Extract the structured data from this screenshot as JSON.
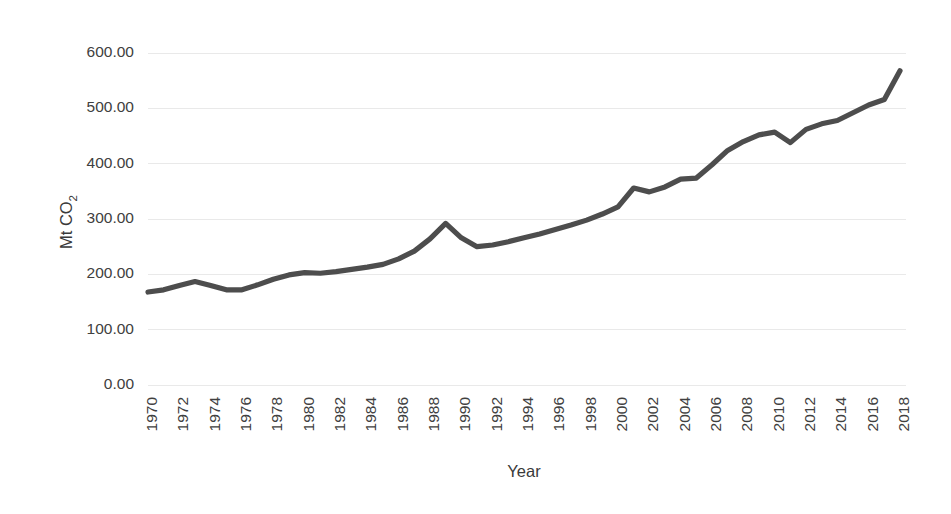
{
  "chart_data": {
    "type": "line",
    "title": "",
    "xlabel": "Year",
    "ylabel": "Mt CO2",
    "ylabel_base": "Mt CO",
    "ylabel_sub": "2",
    "xlim": [
      1970,
      2018
    ],
    "ylim": [
      0,
      600
    ],
    "grid": true,
    "legend": false,
    "line_color": "#4d4d4d",
    "ytick_labels": [
      "600.00",
      "500.00",
      "400.00",
      "300.00",
      "200.00",
      "100.00",
      "0.00"
    ],
    "ytick_values": [
      600,
      500,
      400,
      300,
      200,
      100,
      0
    ],
    "xtick_labels": [
      "1970",
      "1972",
      "1974",
      "1976",
      "1978",
      "1980",
      "1982",
      "1984",
      "1986",
      "1988",
      "1990",
      "1992",
      "1994",
      "1996",
      "1998",
      "2000",
      "2002",
      "2004",
      "2006",
      "2008",
      "2010",
      "2012",
      "2014",
      "2016",
      "2018"
    ],
    "xtick_values": [
      1970,
      1972,
      1974,
      1976,
      1978,
      1980,
      1982,
      1984,
      1986,
      1988,
      1990,
      1992,
      1994,
      1996,
      1998,
      2000,
      2002,
      2004,
      2006,
      2008,
      2010,
      2012,
      2014,
      2016,
      2018
    ],
    "x": [
      1970,
      1971,
      1972,
      1973,
      1974,
      1975,
      1976,
      1977,
      1978,
      1979,
      1980,
      1981,
      1982,
      1983,
      1984,
      1985,
      1986,
      1987,
      1988,
      1989,
      1990,
      1991,
      1992,
      1993,
      1994,
      1995,
      1996,
      1997,
      1998,
      1999,
      2000,
      2001,
      2002,
      2003,
      2004,
      2005,
      2006,
      2007,
      2008,
      2009,
      2010,
      2011,
      2012,
      2013,
      2014,
      2015,
      2016,
      2017,
      2018
    ],
    "values": [
      168,
      172,
      180,
      187,
      180,
      172,
      172,
      180,
      190,
      198,
      202,
      202,
      204,
      208,
      212,
      216,
      226,
      240,
      262,
      292,
      268,
      250,
      252,
      258,
      265,
      272,
      280,
      288,
      297,
      308,
      320,
      332,
      344,
      352,
      358,
      352,
      360,
      370,
      372,
      372,
      388,
      404,
      420,
      435,
      448,
      456,
      457,
      438,
      452
    ],
    "values_tail": [
      462,
      470,
      476,
      484,
      494,
      502,
      510,
      520,
      530,
      540,
      545,
      558,
      568
    ],
    "series": [
      {
        "name": "Mt CO2",
        "points": [
          {
            "year": 1970,
            "value": 168
          },
          {
            "year": 1971,
            "value": 172
          },
          {
            "year": 1972,
            "value": 180
          },
          {
            "year": 1973,
            "value": 187
          },
          {
            "year": 1974,
            "value": 180
          },
          {
            "year": 1975,
            "value": 172
          },
          {
            "year": 1976,
            "value": 172
          },
          {
            "year": 1977,
            "value": 181
          },
          {
            "year": 1978,
            "value": 191
          },
          {
            "year": 1979,
            "value": 199
          },
          {
            "year": 1980,
            "value": 203
          },
          {
            "year": 1981,
            "value": 202
          },
          {
            "year": 1982,
            "value": 205
          },
          {
            "year": 1983,
            "value": 209
          },
          {
            "year": 1984,
            "value": 213
          },
          {
            "year": 1985,
            "value": 218
          },
          {
            "year": 1986,
            "value": 228
          },
          {
            "year": 1987,
            "value": 242
          },
          {
            "year": 1988,
            "value": 264
          },
          {
            "year": 1989,
            "value": 292
          },
          {
            "year": 1990,
            "value": 266
          },
          {
            "year": 1991,
            "value": 250
          },
          {
            "year": 1992,
            "value": 253
          },
          {
            "year": 1993,
            "value": 259
          },
          {
            "year": 1994,
            "value": 266
          },
          {
            "year": 1995,
            "value": 273
          },
          {
            "year": 1996,
            "value": 281
          },
          {
            "year": 1997,
            "value": 289
          },
          {
            "year": 1998,
            "value": 298
          },
          {
            "year": 1999,
            "value": 309
          },
          {
            "year": 2000,
            "value": 322
          },
          {
            "year": 2001,
            "value": 356
          },
          {
            "year": 2002,
            "value": 349
          },
          {
            "year": 2003,
            "value": 358
          },
          {
            "year": 2004,
            "value": 372
          },
          {
            "year": 2005,
            "value": 374
          },
          {
            "year": 2006,
            "value": 398
          },
          {
            "year": 2007,
            "value": 424
          },
          {
            "year": 2008,
            "value": 440
          },
          {
            "year": 2009,
            "value": 452
          },
          {
            "year": 2010,
            "value": 457
          },
          {
            "year": 2011,
            "value": 438
          },
          {
            "year": 2012,
            "value": 462
          },
          {
            "year": 2013,
            "value": 472
          },
          {
            "year": 2014,
            "value": 478
          },
          {
            "year": 2015,
            "value": 492
          },
          {
            "year": 2016,
            "value": 506
          },
          {
            "year": 2017,
            "value": 516
          },
          {
            "year": 2018,
            "value": 568
          }
        ]
      }
    ],
    "plot_area": {
      "left": 148,
      "right": 900,
      "top": 53,
      "bottom": 385
    }
  }
}
